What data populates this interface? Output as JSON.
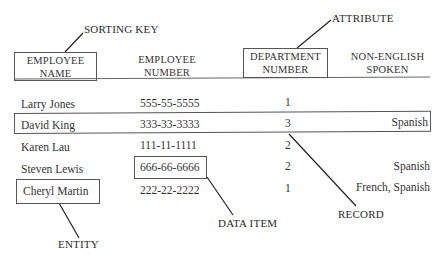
{
  "annotations": {
    "sorting_key": "SORTING KEY",
    "attribute": "ATTRIBUTE",
    "entity": "ENTITY",
    "data_item": "DATA ITEM",
    "record": "RECORD"
  },
  "table": {
    "headers": [
      {
        "line1": "EMPLOYEE",
        "line2": "NAME"
      },
      {
        "line1": "EMPLOYEE",
        "line2": "NUMBER"
      },
      {
        "line1": "DEPARTMENT",
        "line2": "NUMBER"
      },
      {
        "line1": "NON-ENGLISH",
        "line2": "SPOKEN"
      }
    ],
    "rows": [
      {
        "name": "Larry Jones",
        "number": "555-55-5555",
        "dept": "1",
        "language": ""
      },
      {
        "name": "David King",
        "number": "333-33-3333",
        "dept": "3",
        "language": "Spanish"
      },
      {
        "name": "Karen Lau",
        "number": "111-11-1111",
        "dept": "2",
        "language": ""
      },
      {
        "name": "Steven Lewis",
        "number": "666-66-6666",
        "dept": "2",
        "language": "Spanish"
      },
      {
        "name": "Cheryl Martin",
        "number": "222-22-2222",
        "dept": "1",
        "language": "French, Spanish"
      }
    ]
  },
  "colors": {
    "ink": "#2a2a2a",
    "line": "#555555",
    "background": "#ffffff"
  }
}
